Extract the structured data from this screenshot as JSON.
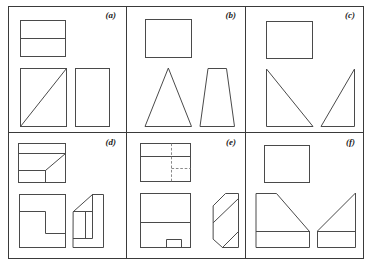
{
  "figure": {
    "kind": "engineering-drawing",
    "width": 370,
    "height": 265,
    "background_color": "#ffffff",
    "line_color": "#4a4a4a",
    "frame_color": "#3a3a3a",
    "hidden_line_color": "#7d7d7d",
    "label_color": "#1c1c1c",
    "grid": {
      "columns": 3,
      "rows": 2,
      "total_panels": 6
    }
  },
  "panels": [
    {
      "id": "a",
      "label": "(a)",
      "row": 0,
      "column": 0,
      "views": [
        {
          "name": "top-view",
          "description": "Rectangle divided by one horizontal line near the upper third"
        },
        {
          "name": "front-view",
          "description": "Square with a diagonal from the bottom-left corner to the top-right corner"
        },
        {
          "name": "side-view",
          "description": "Plain vertical rectangle"
        }
      ]
    },
    {
      "id": "b",
      "label": "(b)",
      "row": 0,
      "column": 1,
      "views": [
        {
          "name": "top-view",
          "description": "Plain rectangle"
        },
        {
          "name": "front-view",
          "description": "Isosceles triangle with apex at top center"
        },
        {
          "name": "side-view",
          "description": "Trapezoid with a narrow top edge and wide base"
        }
      ]
    },
    {
      "id": "c",
      "label": "(c)",
      "row": 0,
      "column": 2,
      "views": [
        {
          "name": "top-view",
          "description": "Plain rectangle"
        },
        {
          "name": "front-view",
          "description": "Right triangle, vertical left edge, hypotenuse falling to the right"
        },
        {
          "name": "side-view",
          "description": "Right triangle, vertical right edge, hypotenuse rising to the right"
        }
      ]
    },
    {
      "id": "d",
      "label": "(d)",
      "row": 1,
      "column": 0,
      "views": [
        {
          "name": "top-view",
          "description": "Rectangle with two horizontal lines, a short vertical line and a diagonal to the top-right corner"
        },
        {
          "name": "front-view",
          "description": "Rectangle with an L-shaped step notched from the right interior"
        },
        {
          "name": "side-view",
          "description": "Stepped block profile with a sloped upper-left face and two interior vertical lines"
        }
      ]
    },
    {
      "id": "e",
      "label": "(e)",
      "row": 1,
      "column": 1,
      "views": [
        {
          "name": "top-view",
          "description": "Rectangle with a solid horizontal line near the top, a vertical hidden dashed line, and a horizontal hidden dashed line to the right"
        },
        {
          "name": "front-view",
          "description": "Rectangle with a horizontal divider and a small notch rectangle at the bottom"
        },
        {
          "name": "side-view",
          "description": "Block with chamfered top-left and bottom-left corners and two parallel interior diagonals"
        }
      ]
    },
    {
      "id": "f",
      "label": "(f)",
      "row": 1,
      "column": 2,
      "views": [
        {
          "name": "top-view",
          "description": "Plain rectangle"
        },
        {
          "name": "front-view",
          "description": "Block with a sloped top-right face and a horizontal line near the base"
        },
        {
          "name": "side-view",
          "description": "Triangle rising to the top-right over a base strip divided by a horizontal line"
        }
      ]
    }
  ]
}
